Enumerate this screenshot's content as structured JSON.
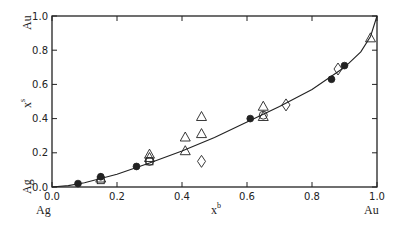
{
  "chart_data": {
    "type": "scatter",
    "title": "",
    "xlabel": "x^b",
    "ylabel": "x^s",
    "xlim": [
      0,
      1.0
    ],
    "ylim": [
      0,
      1.0
    ],
    "grid": false,
    "legend": null,
    "x_ticks": [
      "0.0",
      "0.2",
      "0.4",
      "0.6",
      "0.8",
      "1.0"
    ],
    "y_ticks": [
      "0.0",
      "0.2",
      "0.4",
      "0.6",
      "0.8",
      "1.0"
    ],
    "annotations": {
      "x_left": "Ag",
      "x_right": "Au",
      "y_bottom": "Ag",
      "y_top": "Au"
    },
    "series": [
      {
        "name": "filled-circles",
        "marker": "filled-circle",
        "points": [
          [
            0.08,
            0.02
          ],
          [
            0.15,
            0.06
          ],
          [
            0.26,
            0.12
          ],
          [
            0.61,
            0.4
          ],
          [
            0.86,
            0.63
          ],
          [
            0.9,
            0.71
          ]
        ]
      },
      {
        "name": "triangles",
        "marker": "open-triangle",
        "points": [
          [
            0.15,
            0.05
          ],
          [
            0.3,
            0.19
          ],
          [
            0.3,
            0.17
          ],
          [
            0.41,
            0.29
          ],
          [
            0.41,
            0.21
          ],
          [
            0.46,
            0.41
          ],
          [
            0.46,
            0.31
          ],
          [
            0.65,
            0.47
          ],
          [
            0.65,
            0.41
          ],
          [
            0.98,
            0.87
          ]
        ]
      },
      {
        "name": "open-circles",
        "marker": "open-circle",
        "points": [
          [
            0.3,
            0.15
          ],
          [
            0.65,
            0.42
          ]
        ]
      },
      {
        "name": "diamonds",
        "marker": "open-diamond",
        "points": [
          [
            0.46,
            0.15
          ],
          [
            0.72,
            0.48
          ],
          [
            0.88,
            0.69
          ]
        ]
      },
      {
        "name": "squares",
        "marker": "open-square",
        "points": [
          [
            0.15,
            0.04
          ],
          [
            0.3,
            0.15
          ]
        ]
      },
      {
        "name": "fit-curve",
        "marker": "line",
        "points": [
          [
            0.0,
            0.0
          ],
          [
            0.05,
            0.008
          ],
          [
            0.1,
            0.025
          ],
          [
            0.2,
            0.075
          ],
          [
            0.3,
            0.14
          ],
          [
            0.4,
            0.21
          ],
          [
            0.5,
            0.29
          ],
          [
            0.6,
            0.38
          ],
          [
            0.7,
            0.47
          ],
          [
            0.8,
            0.57
          ],
          [
            0.9,
            0.7
          ],
          [
            0.95,
            0.79
          ],
          [
            0.98,
            0.88
          ],
          [
            1.0,
            1.0
          ]
        ]
      }
    ]
  }
}
